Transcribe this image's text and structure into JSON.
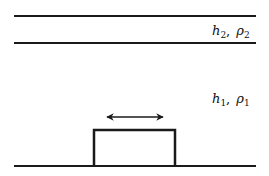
{
  "diagram": {
    "type": "two-layer fluid over a moving rectangular obstacle",
    "colors": {
      "line": "#1a1a1a",
      "background": "#ffffff"
    },
    "layers": [
      {
        "name": "upper",
        "depth_symbol": "h",
        "density_symbol": "ρ",
        "index": "2",
        "separator": ","
      },
      {
        "name": "lower",
        "depth_symbol": "h",
        "density_symbol": "ρ",
        "index": "1",
        "separator": ","
      }
    ],
    "obstacle": {
      "shape": "rectangle",
      "motion": "bidirectional-horizontal-arrow"
    }
  }
}
